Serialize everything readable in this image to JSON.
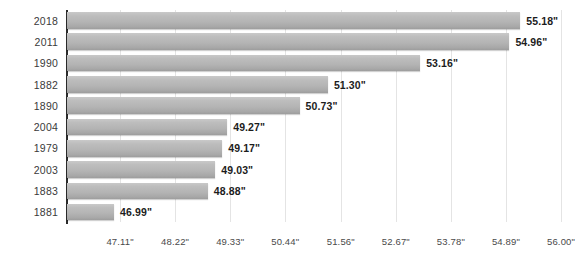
{
  "chart_data": {
    "type": "bar",
    "orientation": "horizontal",
    "title": "",
    "subtitle": "",
    "xlabel": "",
    "ylabel": "",
    "categories": [
      "2018",
      "2011",
      "1990",
      "1882",
      "1890",
      "2004",
      "1979",
      "2003",
      "1883",
      "1881"
    ],
    "values": [
      55.18,
      54.96,
      53.16,
      51.3,
      50.73,
      49.27,
      49.17,
      49.03,
      48.88,
      46.99
    ],
    "value_labels": [
      "55.18\"",
      "54.96\"",
      "53.16\"",
      "51.30\"",
      "50.73\"",
      "49.27\"",
      "49.17\"",
      "49.03\"",
      "48.88\"",
      "46.99\""
    ],
    "unit": "\"",
    "xlim": [
      46.04,
      56.0
    ],
    "xticks": [
      47.11,
      48.22,
      49.33,
      50.44,
      51.56,
      52.67,
      53.78,
      54.89,
      56.0
    ],
    "xtick_labels": [
      "47.11\"",
      "48.22\"",
      "49.33\"",
      "50.44\"",
      "51.56\"",
      "52.67\"",
      "53.78\"",
      "54.89\"",
      "56.00\""
    ],
    "grid": {
      "vertical": true,
      "horizontal": false
    },
    "legend": {
      "visible": false,
      "position": "none"
    },
    "colors": {
      "bar_top": "#c9c9c9",
      "bar_bottom": "#9d9d9d",
      "gridline": "#e4e4e4",
      "axis_spine": "#2b2b2b",
      "category_label": "#3a3a3a",
      "value_label": "#1c1c1c",
      "tick_label": "#4a4a4a",
      "background": "#ffffff"
    },
    "rows": [
      {
        "category": "2018",
        "value": 55.18,
        "label": "55.18\""
      },
      {
        "category": "2011",
        "value": 54.96,
        "label": "54.96\""
      },
      {
        "category": "1990",
        "value": 53.16,
        "label": "53.16\""
      },
      {
        "category": "1882",
        "value": 51.3,
        "label": "51.30\""
      },
      {
        "category": "1890",
        "value": 50.73,
        "label": "50.73\""
      },
      {
        "category": "2004",
        "value": 49.27,
        "label": "49.27\""
      },
      {
        "category": "1979",
        "value": 49.17,
        "label": "49.17\""
      },
      {
        "category": "2003",
        "value": 49.03,
        "label": "49.03\""
      },
      {
        "category": "1883",
        "value": 48.88,
        "label": "48.88\""
      },
      {
        "category": "1881",
        "value": 46.99,
        "label": "46.99\""
      }
    ]
  }
}
